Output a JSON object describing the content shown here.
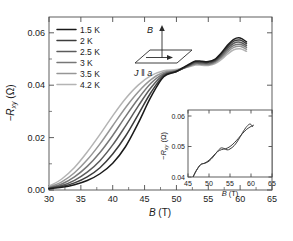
{
  "figure": {
    "background": "#ffffff",
    "width": 293,
    "height": 241
  },
  "main_axes": {
    "xlabel_var": "B",
    "xlabel_unit": " (T)",
    "ylabel_prefix": "−R",
    "ylabel_sub": "xy",
    "ylabel_unit": " (Ω)",
    "xticks": [
      "30",
      "35",
      "40",
      "45",
      "50",
      "55",
      "60",
      "65"
    ],
    "yticks": [
      "0.00",
      "0.02",
      "0.04",
      "0.06"
    ],
    "xlim": [
      30,
      65
    ],
    "ylim": [
      0.0,
      0.066
    ]
  },
  "legend": {
    "entries": [
      {
        "label": "1.5 K",
        "color": "#1a1a1a"
      },
      {
        "label": "2 K",
        "color": "#3d3d3d"
      },
      {
        "label": "2.5 K",
        "color": "#5c5c5c"
      },
      {
        "label": "3 K",
        "color": "#777777"
      },
      {
        "label": "3.5 K",
        "color": "#969696"
      },
      {
        "label": "4.2 K",
        "color": "#b4b4b4"
      }
    ]
  },
  "schematic": {
    "field_label": "B",
    "current_label": "J ‖ a",
    "name": "sample-orientation-schematic"
  },
  "inset_axes": {
    "xlabel_var": "B",
    "xlabel_unit": " (T)",
    "ylabel_prefix": "−R",
    "ylabel_sub": "xy",
    "ylabel_unit": " (Ω)",
    "xticks": [
      "45",
      "50",
      "55",
      "60",
      "65"
    ],
    "yticks": [
      "0.04",
      "0.05",
      "0.06"
    ],
    "xlim": [
      45,
      65
    ],
    "ylim": [
      0.04,
      0.062
    ]
  },
  "chart_data": {
    "type": "line",
    "title": "",
    "xlabel": "B (T)",
    "ylabel": "−R_xy (Ω)",
    "xlim": [
      30,
      65
    ],
    "ylim": [
      0.0,
      0.066
    ],
    "grid": false,
    "legend_position": "upper-left",
    "x": [
      30,
      32,
      34,
      36,
      38,
      40,
      42,
      44,
      46,
      48,
      50,
      52,
      53,
      54,
      55,
      56,
      57,
      58,
      59,
      60,
      61
    ],
    "series": [
      {
        "name": "1.5 K",
        "color": "#1a1a1a",
        "values": [
          0.0005,
          0.001,
          0.002,
          0.0036,
          0.0062,
          0.0102,
          0.0165,
          0.0255,
          0.0355,
          0.0432,
          0.0452,
          0.048,
          0.0492,
          0.0491,
          0.049,
          0.0498,
          0.0522,
          0.0552,
          0.0575,
          0.058,
          0.0565
        ]
      },
      {
        "name": "2 K",
        "color": "#3d3d3d",
        "values": [
          0.0006,
          0.0013,
          0.0027,
          0.005,
          0.0085,
          0.0137,
          0.0205,
          0.0288,
          0.0372,
          0.0436,
          0.0452,
          0.0478,
          0.0489,
          0.0488,
          0.0487,
          0.0495,
          0.0518,
          0.0546,
          0.0568,
          0.0572,
          0.0558
        ]
      },
      {
        "name": "2.5 K",
        "color": "#5c5c5c",
        "values": [
          0.0007,
          0.0017,
          0.0037,
          0.0068,
          0.0112,
          0.0172,
          0.0244,
          0.032,
          0.039,
          0.044,
          0.0453,
          0.0476,
          0.0486,
          0.0485,
          0.0484,
          0.0492,
          0.0513,
          0.054,
          0.056,
          0.0564,
          0.0551
        ]
      },
      {
        "name": "3 K",
        "color": "#777777",
        "values": [
          0.0009,
          0.0023,
          0.005,
          0.009,
          0.0143,
          0.0208,
          0.028,
          0.0348,
          0.0407,
          0.0444,
          0.0455,
          0.0474,
          0.0483,
          0.0482,
          0.0481,
          0.0489,
          0.0508,
          0.0533,
          0.0552,
          0.0556,
          0.0544
        ]
      },
      {
        "name": "3.5 K",
        "color": "#969696",
        "values": [
          0.0011,
          0.0031,
          0.0066,
          0.0115,
          0.0176,
          0.0245,
          0.0314,
          0.0374,
          0.0421,
          0.0449,
          0.0457,
          0.0472,
          0.048,
          0.0479,
          0.0478,
          0.0485,
          0.0503,
          0.0526,
          0.0544,
          0.0548,
          0.0537
        ]
      },
      {
        "name": "4.2 K",
        "color": "#b4b4b4",
        "values": [
          0.0014,
          0.0042,
          0.0086,
          0.0145,
          0.0212,
          0.0283,
          0.0348,
          0.04,
          0.0436,
          0.0455,
          0.046,
          0.047,
          0.0477,
          0.0476,
          0.0475,
          0.0481,
          0.0497,
          0.0518,
          0.0535,
          0.0539,
          0.0529
        ]
      }
    ],
    "inset": {
      "type": "line",
      "xlabel": "B (T)",
      "ylabel": "−R_xy (Ω)",
      "xlim": [
        45,
        65
      ],
      "ylim": [
        0.04,
        0.062
      ],
      "grid": false,
      "series": [
        {
          "name": "up-sweep",
          "color": "#3a3a3a",
          "x": [
            46.2,
            47.0,
            48.0,
            49.0,
            50.0,
            51.0,
            52.0,
            52.8,
            53.5,
            54.3,
            55.0,
            56.0,
            57.0,
            58.0,
            59.0,
            59.8,
            60.4
          ],
          "values": [
            0.04,
            0.0422,
            0.0441,
            0.0445,
            0.0452,
            0.0466,
            0.0484,
            0.0495,
            0.0494,
            0.0489,
            0.0492,
            0.0503,
            0.0522,
            0.0546,
            0.0566,
            0.0574,
            0.0565
          ]
        },
        {
          "name": "down-sweep",
          "color": "#3a3a3a",
          "x": [
            46.2,
            47.0,
            48.0,
            49.0,
            50.0,
            51.0,
            52.0,
            53.0,
            54.0,
            55.0,
            56.0,
            57.0,
            58.0,
            59.0,
            60.0,
            60.6
          ],
          "values": [
            0.04,
            0.0421,
            0.044,
            0.0446,
            0.0455,
            0.0469,
            0.0483,
            0.049,
            0.0493,
            0.05,
            0.0512,
            0.0527,
            0.0543,
            0.0557,
            0.0566,
            0.057
          ]
        }
      ]
    }
  }
}
